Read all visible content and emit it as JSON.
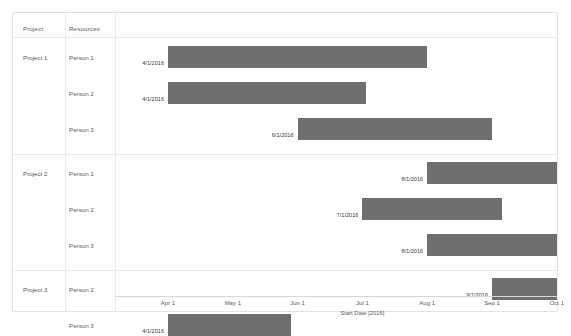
{
  "table": {
    "headers": {
      "project": "Project",
      "resources": "Resources"
    }
  },
  "chart_data": {
    "type": "bar",
    "orientation": "horizontal",
    "subtype": "gantt",
    "title": "",
    "xlabel": "Start Date [2016]",
    "ylabel": "",
    "grid": false,
    "legend": "none",
    "bar_color": "#6f6f6f",
    "xticks": [
      "Apr 1",
      "May 1",
      "Jun 1",
      "Jul 1",
      "Aug 1",
      "Sep 1",
      "Oct 1"
    ],
    "xtick_values": [
      "2016-04-01",
      "2016-05-01",
      "2016-06-01",
      "2016-07-01",
      "2016-08-01",
      "2016-09-01",
      "2016-10-01"
    ],
    "xlim": [
      "2016-03-20",
      "2016-10-10"
    ],
    "groups": [
      {
        "project": "Project 1",
        "rows": [
          {
            "resource": "Person 1",
            "label": "4/1/2016",
            "start": "2016-04-01",
            "end": "2016-08-01",
            "start_month": 4.0,
            "end_month": 8.0
          },
          {
            "resource": "Person 2",
            "label": "4/1/2016",
            "start": "2016-04-01",
            "end": "2016-07-02",
            "start_month": 4.0,
            "end_month": 7.05
          },
          {
            "resource": "Person 3",
            "label": "6/1/2016",
            "start": "2016-06-01",
            "end": "2016-09-01",
            "start_month": 6.0,
            "end_month": 9.0
          }
        ]
      },
      {
        "project": "Project 2",
        "rows": [
          {
            "resource": "Person 1",
            "label": "8/1/2016",
            "start": "2016-08-01",
            "end": "2016-10-01",
            "start_month": 8.0,
            "end_month": 10.0
          },
          {
            "resource": "Person 2",
            "label": "7/1/2016",
            "start": "2016-07-01",
            "end": "2016-09-05",
            "start_month": 7.0,
            "end_month": 9.15
          },
          {
            "resource": "Person 3",
            "label": "8/1/2016",
            "start": "2016-08-01",
            "end": "2016-10-01",
            "start_month": 8.0,
            "end_month": 10.0
          }
        ]
      },
      {
        "project": "Project 3",
        "rows": [
          {
            "resource": "Person 2",
            "label": "9/1/2016",
            "start": "2016-09-01",
            "end": "2016-10-01",
            "start_month": 9.0,
            "end_month": 10.0
          },
          {
            "resource": "Person 3",
            "label": "4/1/2016",
            "start": "2016-04-01",
            "end": "2016-05-28",
            "start_month": 4.0,
            "end_month": 5.9
          }
        ]
      }
    ]
  }
}
